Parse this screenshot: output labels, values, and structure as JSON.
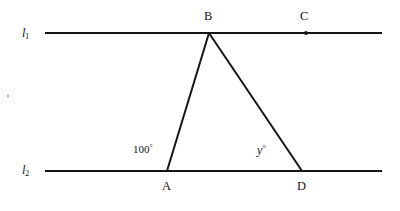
{
  "figure": {
    "type": "geometry-diagram",
    "background_color": "#ffffff",
    "stroke_color": "#151515"
  },
  "lines": {
    "l1": {
      "label": "l",
      "subscript": "1",
      "x1": 45,
      "y1": 33,
      "x2": 382,
      "y2": 33
    },
    "l2": {
      "label": "l",
      "subscript": "2",
      "x1": 45,
      "y1": 171,
      "x2": 382,
      "y2": 171
    }
  },
  "points": {
    "A": {
      "label": "A",
      "x": 167,
      "y": 171,
      "on_line": "l2",
      "marked": false
    },
    "B": {
      "label": "B",
      "x": 209,
      "y": 33,
      "on_line": "l1",
      "marked": false
    },
    "C": {
      "label": "C",
      "x": 306,
      "y": 33,
      "on_line": "l1",
      "marked": true
    },
    "D": {
      "label": "D",
      "x": 302,
      "y": 171,
      "on_line": "l2",
      "marked": false
    }
  },
  "segments": [
    {
      "name": "AB",
      "from": "A",
      "to": "B"
    },
    {
      "name": "BD",
      "from": "B",
      "to": "D"
    }
  ],
  "angles": {
    "at_A": {
      "value": "100",
      "degree_symbol": "°",
      "text": "100°",
      "vertex": "A"
    },
    "at_D": {
      "value": "y",
      "degree_symbol": "°",
      "text": "y°",
      "vertex": "D"
    }
  }
}
